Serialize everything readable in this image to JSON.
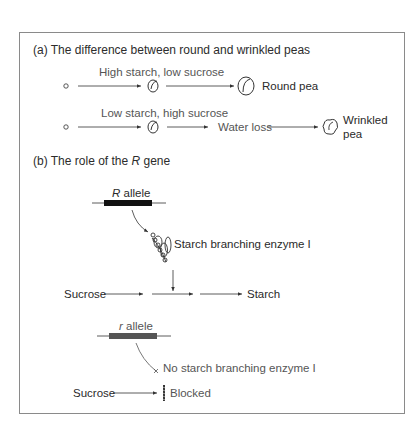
{
  "section_a": {
    "title": "(a) The difference between round and wrinkled peas",
    "round": {
      "condition_label": "High starch, low sucrose",
      "result_label": "Round pea"
    },
    "wrinkled": {
      "condition_label": "Low starch, high sucrose",
      "intermediate_label": "Water loss",
      "result_label_line1": "Wrinkled",
      "result_label_line2": "pea"
    }
  },
  "section_b": {
    "title_prefix": "(b) The role of the ",
    "title_gene": "R",
    "title_suffix": " gene",
    "dominant": {
      "allele_symbol": "R",
      "allele_word": " allele",
      "enzyme_label": "Starch branching enzyme I",
      "pathway_start": "Sucrose",
      "pathway_end": "Starch"
    },
    "recessive": {
      "allele_symbol": "r",
      "allele_word": " allele",
      "enzyme_label": "No starch branching enzyme I",
      "pathway_start": "Sucrose",
      "pathway_end": "Blocked"
    }
  },
  "colors": {
    "border": "#8a8a8a",
    "dominant_allele_bar": "#111111",
    "recessive_allele_bar": "#555555",
    "lines": "#333333"
  }
}
